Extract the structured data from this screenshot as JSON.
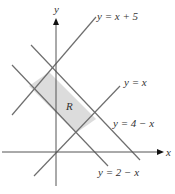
{
  "figure": {
    "axes": {
      "x_label": "x",
      "y_label": "y"
    },
    "region_label": "R",
    "region_color": "#dcdcdc",
    "line_color": "#6e6e6e",
    "lines": [
      {
        "id": "l1",
        "label": "y = x + 5"
      },
      {
        "id": "l2",
        "label": "y = x"
      },
      {
        "id": "l3",
        "label": "y = 4 − x"
      },
      {
        "id": "l4",
        "label": "y = 2 − x"
      }
    ]
  }
}
